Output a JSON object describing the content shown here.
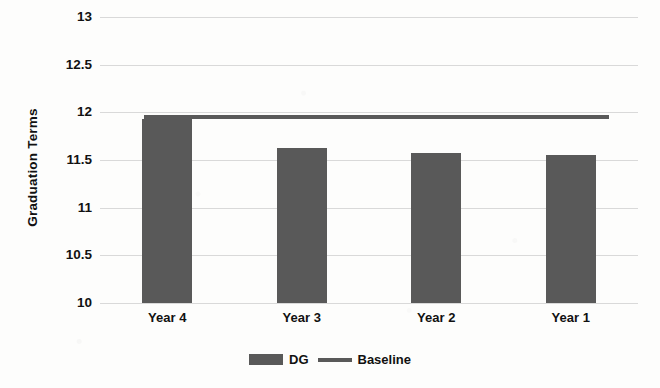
{
  "chart_data": {
    "type": "bar",
    "title": "",
    "subtitle": "",
    "xlabel": "",
    "ylabel": "Graduation Terms",
    "categories": [
      "Year 4",
      "Year 3",
      "Year 2",
      "Year 1"
    ],
    "ylim": [
      10,
      13
    ],
    "ytick_step": 0.5,
    "ytick_labels": [
      "13",
      "12.5",
      "12",
      "11.5",
      "11",
      "10.5",
      "10"
    ],
    "ytick_values": [
      13,
      12.5,
      12,
      11.5,
      11,
      10.5,
      10
    ],
    "grid": true,
    "legend_position": "bottom-center",
    "series": [
      {
        "name": "DG",
        "type": "bar",
        "color": "#595959",
        "values": [
          11.93,
          11.63,
          11.57,
          11.55
        ]
      },
      {
        "name": "Baseline",
        "type": "line",
        "color": "#595959",
        "constant_value": 11.95,
        "values": [
          11.95,
          11.95,
          11.95,
          11.95
        ]
      }
    ]
  },
  "colors": {
    "series": "#595959",
    "gridline": "#d9d9d9",
    "background": "#fdfdfc",
    "text": "#111111"
  },
  "legend": {
    "entries": [
      {
        "label": "DG",
        "marker": "bar-swatch"
      },
      {
        "label": "Baseline",
        "marker": "line-swatch"
      }
    ]
  },
  "artifacts": {
    "bleed_through_text": "scanned page bleed-through"
  }
}
